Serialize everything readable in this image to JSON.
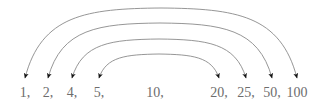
{
  "figure": {
    "background_color": "#ffffff",
    "arc_color": "#8a8a8a",
    "arrow_color": "#1a1a1a",
    "text_color": "#6d6d6d"
  },
  "sequence": {
    "separator": ",",
    "items": [
      {
        "label": "1,",
        "value": "1",
        "x": 25
      },
      {
        "label": "2,",
        "value": "2",
        "x": 48
      },
      {
        "label": "4,",
        "value": "4",
        "x": 72
      },
      {
        "label": "5,",
        "value": "5",
        "x": 99
      },
      {
        "label": "10,",
        "value": "10",
        "x": 155
      },
      {
        "label": "20,",
        "value": "20",
        "x": 219
      },
      {
        "label": "25,",
        "value": "25",
        "x": 246
      },
      {
        "label": "50,",
        "value": "50",
        "x": 272
      },
      {
        "label": "100",
        "value": "100",
        "x": 297
      }
    ]
  },
  "chart_data": {
    "type": "diagram",
    "title": "",
    "nodes": [
      "1",
      "2",
      "4",
      "5",
      "10",
      "20",
      "25",
      "50",
      "100"
    ],
    "node_x": [
      25,
      48,
      72,
      99,
      155,
      219,
      246,
      272,
      297
    ],
    "arcs": [
      {
        "from": "1",
        "to": "100",
        "from_x": 25,
        "to_x": 297,
        "peak_y": 8,
        "arrow_tip_y": 78,
        "double_headed": true
      },
      {
        "from": "2",
        "to": "50",
        "from_x": 48,
        "to_x": 272,
        "peak_y": 23,
        "arrow_tip_y": 78,
        "double_headed": true
      },
      {
        "from": "4",
        "to": "25",
        "from_x": 72,
        "to_x": 246,
        "peak_y": 39,
        "arrow_tip_y": 78,
        "double_headed": true
      },
      {
        "from": "5",
        "to": "20",
        "from_x": 99,
        "to_x": 219,
        "peak_y": 54,
        "arrow_tip_y": 78,
        "double_headed": true
      }
    ],
    "unpaired_nodes": [
      "10"
    ],
    "arrow_count": 8,
    "arc_count": 4
  }
}
